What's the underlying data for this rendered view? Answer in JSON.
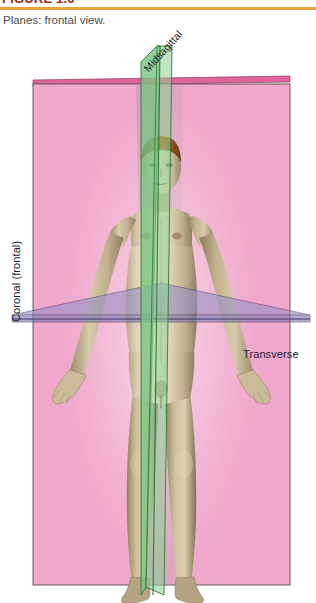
{
  "figure": {
    "title": "FIGURE 1.6",
    "caption": "Planes: frontal view.",
    "rule_color": "#eaa13c",
    "title_color": "#9e2a17"
  },
  "illustration": {
    "subject": "anatomical male figure, anterior (frontal) view, standing, arms abducted with palms forward",
    "planes": [
      {
        "name": "midsagittal",
        "label": "Midsagittal",
        "color": "#6fbf73",
        "edge_color": "#2f7a39",
        "orientation": "vertical, divides body into left and right halves",
        "label_rotation_deg": -48
      },
      {
        "name": "coronal",
        "label": "Coronal (frontal)",
        "color": "#f0a8cc",
        "edge_color": "#e0649e",
        "orientation": "vertical, divides body into anterior and posterior",
        "label_rotation_deg": -90
      },
      {
        "name": "transverse",
        "label": "Transverse",
        "color": "#9a8fc6",
        "edge_color": "#3c3560",
        "orientation": "horizontal, divides body into superior and inferior",
        "label_rotation_deg": 0
      }
    ]
  },
  "colors": {
    "pink_plane_fill": "#f0a8cc",
    "pink_plane_top_edge": "#e0649e",
    "pink_plane_outline": "#5a4a55",
    "green_plane_fill": "#7cc383",
    "green_plane_edge": "#2f7a39",
    "purple_plane_fill": "#9a8fc6",
    "purple_plane_edge": "#3c3560",
    "skin_light": "#e8ddc8",
    "skin_mid": "#c9b894",
    "skin_shadow": "#8f8166",
    "hair": "#8a4a22",
    "body_shadow_grey": "#7d7f86",
    "background": "#ffffff"
  }
}
